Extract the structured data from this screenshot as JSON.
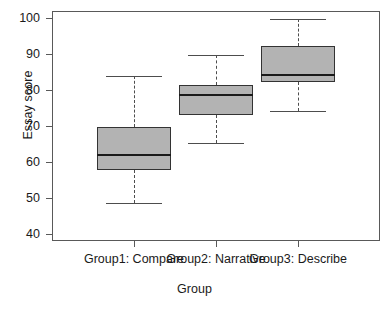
{
  "chart_data": {
    "type": "box",
    "title": "",
    "xlabel": "Group",
    "ylabel": "Essay score",
    "categories": [
      "Group1: Compare",
      "Group2: Narrative",
      "Group3: Describe"
    ],
    "ylim": [
      38,
      102
    ],
    "yticks": [
      40,
      50,
      60,
      70,
      80,
      90,
      100
    ],
    "ytick_labels": [
      "40",
      "50",
      "60",
      "70",
      "80",
      "90",
      "100"
    ],
    "grid": false,
    "legend": null,
    "box_fill_color": "#b3b3b3",
    "box_border_color": "#333333",
    "median_color": "#1a1a1a",
    "whisker_color": "#4d4d4d",
    "boxes": [
      {
        "category": "Group1: Compare",
        "whisker_low": 48.6,
        "q1": 57.8,
        "median": 62.2,
        "q3": 69.8,
        "whisker_high": 83.8
      },
      {
        "category": "Group2: Narrative",
        "whisker_low": 65.4,
        "q1": 73.2,
        "median": 79.0,
        "q3": 81.3,
        "whisker_high": 89.8
      },
      {
        "category": "Group3: Describe",
        "whisker_low": 74.2,
        "q1": 82.2,
        "median": 84.6,
        "q3": 92.3,
        "whisker_high": 99.8
      }
    ]
  }
}
